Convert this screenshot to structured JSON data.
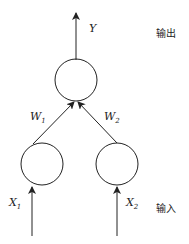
{
  "diagram": {
    "output_label": "Y",
    "output_layer": "输出",
    "input_layer": "输入",
    "weights": [
      {
        "sym": "W",
        "sub": "1"
      },
      {
        "sym": "W",
        "sub": "2"
      }
    ],
    "inputs": [
      {
        "sym": "X",
        "sub": "1"
      },
      {
        "sym": "X",
        "sub": "2"
      }
    ],
    "stroke_color": "#222222"
  }
}
